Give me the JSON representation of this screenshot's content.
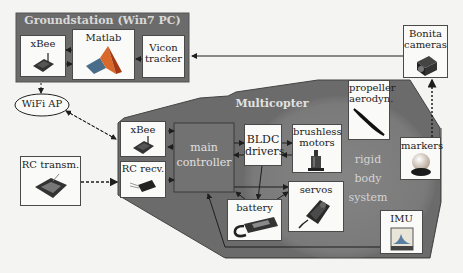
{
  "groundstation": {
    "title": "Groundstation (Win7 PC)",
    "xbee": "xBee",
    "matlab": "Matlab",
    "vicon_line1": "Vicon",
    "vicon_line2": "tracker"
  },
  "wifi_ap": "WiFi AP",
  "rc_transmitter": "RC transm.",
  "cameras": {
    "line1": "Bonita",
    "line2": "cameras"
  },
  "multicopter": {
    "title": "Multicopter",
    "xbee": "xBee",
    "rc_receiver": "RC recv.",
    "main_controller_line1": "main",
    "main_controller_line2": "controller",
    "bldc_line1": "BLDC",
    "bldc_line2": "drivers",
    "motors_line1": "brushless",
    "motors_line2": "motors",
    "propeller_line1": "propeller",
    "propeller_line2": "aerodyn.",
    "markers": "markers",
    "battery": "battery",
    "servos": "servos",
    "imu": "IMU",
    "rigid_body": [
      "rigid",
      "body",
      "system"
    ]
  },
  "colors": {
    "dark_region": "#6b6b6b",
    "rigid_body_circle": "#7f7f7f",
    "controller": "#727272",
    "box_bg": "#fafaf8",
    "line": "#1e1e1e"
  }
}
